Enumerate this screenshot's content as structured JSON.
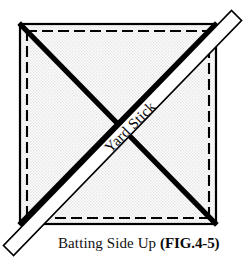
{
  "figure": {
    "caption_main": "Batting Side Up",
    "caption_fig": "(FIG.4-5)",
    "stick_label": "Yard Stick",
    "colors": {
      "fabric_fill": "#f2f2f2",
      "outline": "#000000",
      "stick_fill": "#ffffff",
      "stick_outline": "#000000",
      "text": "#111111"
    },
    "geometry": {
      "square_left": 20,
      "square_top": 24,
      "square_right": 216,
      "square_bottom": 224,
      "dash_inset": 7,
      "diagonal_width": 5,
      "stick_width": 19,
      "stick_angle_deg": -45
    },
    "elements": {
      "fabric_square_name": "fabric square outline",
      "seam_dashes_name": "dashed seam allowance lines",
      "diagonal_a_name": "diagonal corner to corner line",
      "diagonal_b_name": "diagonal corner to corner line",
      "yard_stick_name": "yard stick laid across diagonal"
    }
  }
}
